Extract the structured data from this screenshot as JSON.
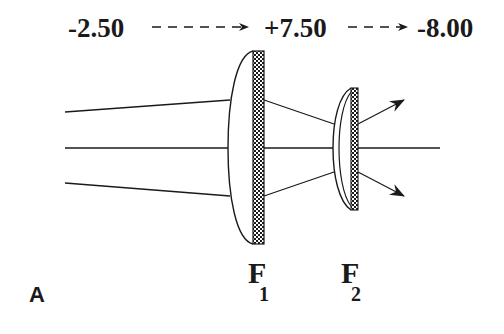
{
  "diagram": {
    "power_sequence": {
      "start": "-2.50",
      "middle": "+7.50",
      "end": "-8.00"
    },
    "lenses": [
      {
        "id": "F1",
        "letter": "F",
        "subscript": "1",
        "type": "plano-convex with textured plate"
      },
      {
        "id": "F2",
        "letter": "F",
        "subscript": "2",
        "type": "meniscus with textured plate"
      }
    ],
    "panel_label": "A",
    "colors": {
      "ink": "#1a1a1a",
      "background": "#ffffff"
    }
  }
}
